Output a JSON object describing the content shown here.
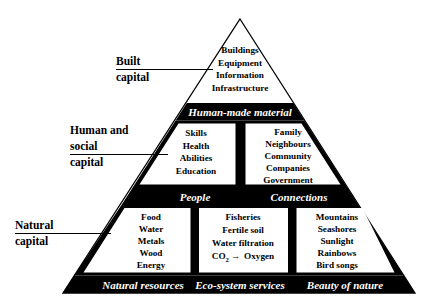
{
  "diagram": {
    "shape": "pyramid",
    "colors": {
      "band_fill": "#000000",
      "band_text": "#ffffff",
      "box_fill": "#ffffff",
      "box_text": "#000000",
      "outline": "#000000"
    }
  },
  "side_labels": [
    {
      "id": "built",
      "lines": [
        "Built",
        "capital"
      ]
    },
    {
      "id": "human_social",
      "lines": [
        "Human and",
        "social",
        "capital"
      ]
    },
    {
      "id": "natural",
      "lines": [
        "Natural",
        "capital"
      ]
    }
  ],
  "tiers": [
    {
      "id": "top",
      "boxes": [
        {
          "id": "built-capital-box",
          "items": [
            "Buildings",
            "Equipment",
            "Information",
            "Infrastructure"
          ]
        }
      ],
      "band": [
        {
          "id": "human-made-material",
          "label": "Human-made material"
        }
      ]
    },
    {
      "id": "middle",
      "boxes": [
        {
          "id": "people-box",
          "items": [
            "Skills",
            "Health",
            "Abilities",
            "Education"
          ]
        },
        {
          "id": "connections-box",
          "items": [
            "Family",
            "Neighbours",
            "Community",
            "Companies",
            "Government"
          ]
        }
      ],
      "band": [
        {
          "id": "people",
          "label": "People"
        },
        {
          "id": "connections",
          "label": "Connections"
        }
      ]
    },
    {
      "id": "bottom",
      "boxes": [
        {
          "id": "natural-resources-box",
          "items": [
            "Food",
            "Water",
            "Metals",
            "Wood",
            "Energy"
          ]
        },
        {
          "id": "eco-system-services-box",
          "items": [
            "Fisheries",
            "Fertile soil",
            "Water filtration"
          ],
          "formula": {
            "prefix": "CO",
            "subscript": "2",
            "arrow": "→",
            "product": "Oxygen"
          }
        },
        {
          "id": "beauty-of-nature-box",
          "items": [
            "Mountains",
            "Seashores",
            "Sunlight",
            "Rainbows",
            "Bird songs"
          ]
        }
      ],
      "band": [
        {
          "id": "natural-resources",
          "label": "Natural resources"
        },
        {
          "id": "eco-system-services",
          "label": "Eco-system services"
        },
        {
          "id": "beauty-of-nature",
          "label": "Beauty of nature"
        }
      ]
    }
  ]
}
